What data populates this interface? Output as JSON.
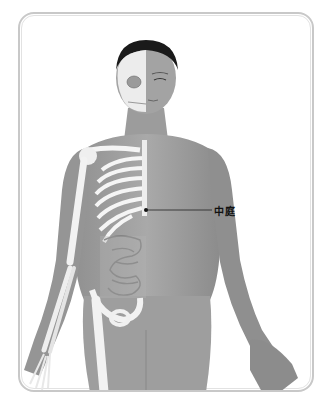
{
  "figure": {
    "acupoint": {
      "label": "中庭",
      "point_x": 146,
      "point_y": 210,
      "line_end_x": 212
    },
    "colors": {
      "frame_border": "#c8c8c8",
      "skin": "#9a9a9a",
      "skin_dark": "#7d7d7d",
      "bone": "#f2f2f2",
      "hair": "#1a1a1a",
      "label": "#111111"
    }
  }
}
